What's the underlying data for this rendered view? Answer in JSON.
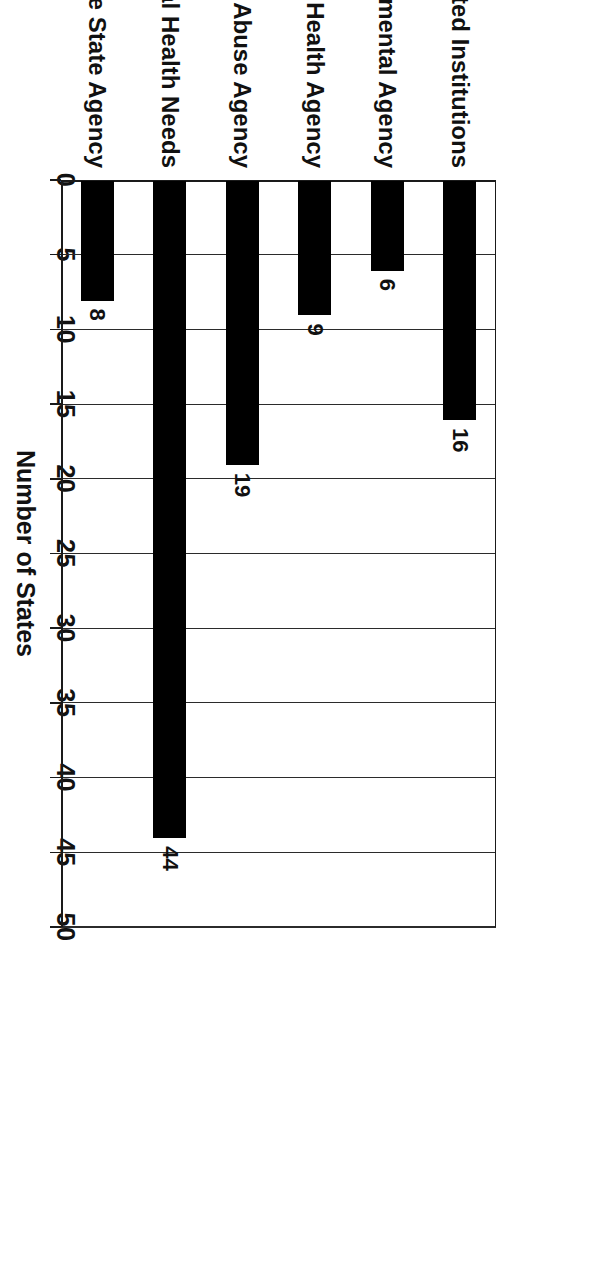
{
  "chart_data": {
    "type": "bar",
    "orientation": "vertical-rotated-90",
    "title": "",
    "xlabel": "",
    "ylabel": "Number of States",
    "ylim": [
      0,
      50
    ],
    "ytick_step": 5,
    "yticks": [
      "0",
      "5",
      "10",
      "15",
      "20",
      "25",
      "30",
      "35",
      "40",
      "45",
      "50"
    ],
    "grid": true,
    "legend": false,
    "bar_color": "#000000",
    "categories": [
      "SHA-Operated Institutions",
      "Lead Environmental Agency",
      "Mental Health Agency",
      "Substance Abuse Agency",
      "Services to Children with Special Health Needs",
      "Medicaid Single State Agency"
    ],
    "values": [
      16,
      6,
      9,
      19,
      44,
      8
    ],
    "data_labels": [
      "16",
      "6",
      "9",
      "19",
      "44",
      "8"
    ]
  }
}
